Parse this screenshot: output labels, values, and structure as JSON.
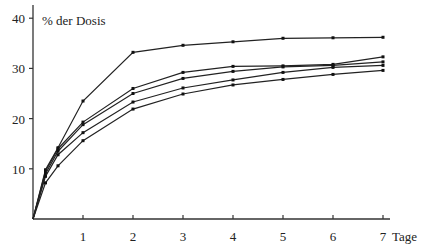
{
  "chart_data": {
    "type": "line",
    "title": "",
    "ylabel": "% der Dosis",
    "xlabel": "Tage",
    "xlim": [
      0,
      7
    ],
    "ylim": [
      0,
      40
    ],
    "x_ticks": [
      1,
      2,
      3,
      4,
      5,
      6,
      7
    ],
    "y_ticks": [
      10,
      20,
      30,
      40
    ],
    "grid": false,
    "legend": null,
    "x": [
      0,
      0.25,
      0.5,
      1,
      2,
      3,
      4,
      5,
      6,
      7
    ],
    "series": [
      {
        "name": "Kurve 1",
        "values": [
          0,
          9.8,
          14.2,
          23.5,
          33.2,
          34.6,
          35.3,
          36.0,
          36.1,
          36.2
        ]
      },
      {
        "name": "Kurve 2",
        "values": [
          0,
          9.5,
          14.0,
          19.3,
          26.0,
          29.2,
          30.4,
          30.5,
          30.8,
          32.3
        ]
      },
      {
        "name": "Kurve 3",
        "values": [
          0,
          9.0,
          13.5,
          18.8,
          25.0,
          28.0,
          29.4,
          30.3,
          30.6,
          31.3
        ]
      },
      {
        "name": "Kurve 4",
        "values": [
          0,
          8.5,
          12.8,
          17.2,
          23.3,
          26.1,
          27.7,
          29.2,
          30.2,
          30.6
        ]
      },
      {
        "name": "Kurve 5",
        "values": [
          0,
          7.2,
          10.6,
          15.6,
          21.9,
          24.9,
          26.7,
          27.8,
          28.8,
          29.6
        ]
      }
    ]
  },
  "labels": {
    "y_title": "% der Dosis",
    "x_title": "Tage"
  }
}
